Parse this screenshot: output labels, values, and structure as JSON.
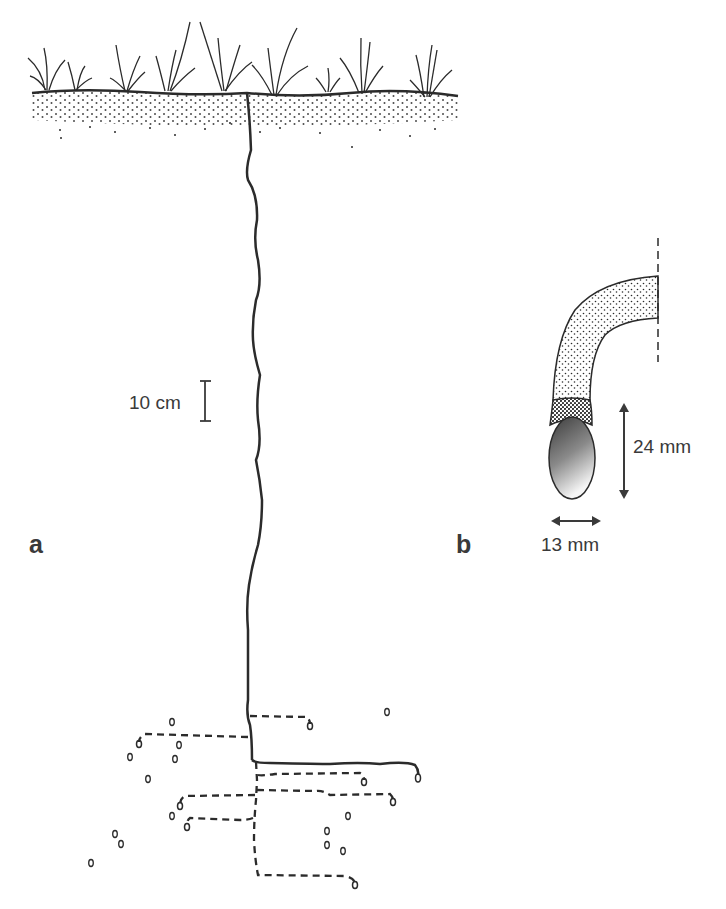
{
  "figure": {
    "panels": [
      {
        "id": "a",
        "label": "a",
        "description": "Vertical burrow descending from grassy soil surface with horizontal side galleries ending in egg chambers",
        "scale_bar": {
          "label": "10 cm"
        }
      },
      {
        "id": "b",
        "label": "b",
        "description": "Detail of terminal chamber containing an egg",
        "dimensions": {
          "length_label": "24 mm",
          "width_label": "13 mm"
        }
      }
    ],
    "colors": {
      "line": "#2b2b2b",
      "text": "#3a3a3a",
      "egg_dark": "#3a3a3a",
      "egg_light": "#f2f2f2",
      "background": "#ffffff"
    }
  }
}
